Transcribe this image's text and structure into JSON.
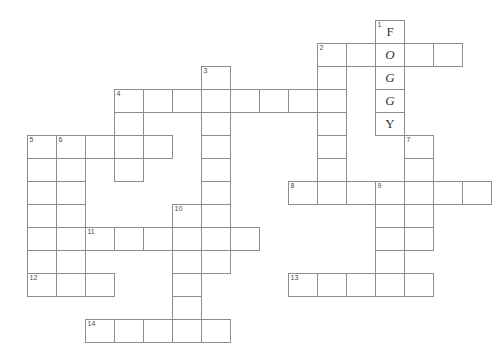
{
  "puzzle": {
    "title": "Crossword Puzzle Grid",
    "cell_width": 29,
    "cell_height": 23,
    "origin_x": 27,
    "origin_y": 20,
    "line_color": "#8c8c8c",
    "cell_fill": "#ffffff",
    "number_color": "#4a4a4a",
    "letter_color": "#333333",
    "background": "#ffffff",
    "filled_answer": "FOGGY",
    "clue_numbers": [
      1,
      2,
      3,
      4,
      5,
      6,
      7,
      8,
      9,
      10,
      11,
      12,
      13,
      14
    ],
    "entries": [
      {
        "number": "1",
        "direction": "down",
        "col": 12,
        "row": 0,
        "length": 5,
        "letters": [
          "F",
          "O",
          "G",
          "G",
          "Y"
        ]
      },
      {
        "number": "2",
        "direction": "across",
        "col": 10,
        "row": 1,
        "length": 5,
        "letters": [
          "",
          "",
          "",
          "",
          ""
        ]
      },
      {
        "number": "2",
        "direction": "down",
        "col": 10,
        "row": 1,
        "length": 7,
        "letters": [
          "",
          "",
          "",
          "",
          "",
          "",
          ""
        ]
      },
      {
        "number": "3",
        "direction": "down",
        "col": 6,
        "row": 2,
        "length": 9,
        "letters": [
          "",
          "",
          "",
          "",
          "",
          "",
          "",
          "",
          ""
        ]
      },
      {
        "number": "4",
        "direction": "across",
        "col": 3,
        "row": 3,
        "length": 7,
        "letters": [
          "",
          "",
          "",
          "",
          "",
          "",
          ""
        ]
      },
      {
        "number": "4",
        "direction": "down",
        "col": 3,
        "row": 3,
        "length": 4,
        "letters": [
          "",
          "",
          "",
          ""
        ]
      },
      {
        "number": "5",
        "direction": "across",
        "col": 0,
        "row": 5,
        "length": 5,
        "letters": [
          "",
          "",
          "",
          "",
          ""
        ]
      },
      {
        "number": "5",
        "direction": "down",
        "col": 0,
        "row": 5,
        "length": 6,
        "letters": [
          "",
          "",
          "",
          "",
          "",
          ""
        ]
      },
      {
        "number": "6",
        "direction": "down",
        "col": 1,
        "row": 5,
        "length": 7,
        "letters": [
          "",
          "",
          "",
          "",
          "",
          "",
          ""
        ]
      },
      {
        "number": "7",
        "direction": "down",
        "col": 13,
        "row": 5,
        "length": 5,
        "letters": [
          "",
          "",
          "",
          "",
          ""
        ]
      },
      {
        "number": "8",
        "direction": "across",
        "col": 9,
        "row": 7,
        "length": 7,
        "letters": [
          "",
          "",
          "",
          "",
          "",
          "",
          ""
        ]
      },
      {
        "number": "9",
        "direction": "down",
        "col": 12,
        "row": 7,
        "length": 5,
        "letters": [
          "",
          "",
          "",
          "",
          ""
        ]
      },
      {
        "number": "10",
        "direction": "down",
        "col": 5,
        "row": 8,
        "length": 6,
        "letters": [
          "",
          "",
          "",
          "",
          "",
          ""
        ]
      },
      {
        "number": "11",
        "direction": "across",
        "col": 2,
        "row": 9,
        "length": 6,
        "letters": [
          "",
          "",
          "",
          "",
          "",
          ""
        ]
      },
      {
        "number": "12",
        "direction": "across",
        "col": 0,
        "row": 11,
        "length": 3,
        "letters": [
          "",
          "",
          ""
        ]
      },
      {
        "number": "13",
        "direction": "across",
        "col": 9,
        "row": 11,
        "length": 5,
        "letters": [
          "",
          "",
          "",
          "",
          ""
        ]
      },
      {
        "number": "14",
        "direction": "across",
        "col": 2,
        "row": 13,
        "length": 5,
        "letters": [
          "",
          "",
          "",
          "",
          ""
        ]
      }
    ]
  }
}
